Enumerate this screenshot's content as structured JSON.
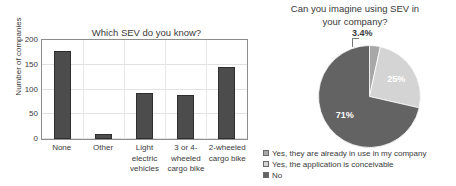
{
  "chart_data": [
    {
      "type": "bar",
      "title": "Which SEV do you know?",
      "xlabel": "",
      "ylabel": "Number of companies",
      "ylim": [
        0,
        200
      ],
      "yticks": [
        0,
        50,
        100,
        150,
        200
      ],
      "grid": true,
      "legend": "none",
      "bar_color": "#4c4c4c",
      "categories": [
        "None",
        "Other",
        "Light electric vehicles",
        "3 or 4- wheeled cargo bike",
        "2-wheeled cargo bike"
      ],
      "category_lines": [
        [
          "None"
        ],
        [
          "Other"
        ],
        [
          "Light",
          "electric",
          "vehicles"
        ],
        [
          "3 or 4-",
          "wheeled",
          "cargo bike"
        ],
        [
          "2-wheeled",
          "cargo bike"
        ]
      ],
      "values": [
        178,
        11,
        92,
        88,
        146
      ]
    },
    {
      "type": "pie",
      "title": "Can you imagine using SEV in your company?",
      "title_lines": [
        "Can you imagine using SEV in",
        "your company?"
      ],
      "legend_position": "bottom",
      "slices": [
        {
          "label": "Yes, they are already in use in my company",
          "value": 3.4,
          "display": "3.4%",
          "color": "#a8a8a8",
          "callout": true
        },
        {
          "label": "Yes, the application is conceivable",
          "value": 25,
          "display": "25%",
          "color": "#d4d4d4",
          "callout": false
        },
        {
          "label": "No",
          "value": 71,
          "display": "71%",
          "color": "#636363",
          "callout": false
        }
      ]
    }
  ],
  "bar_chart": {
    "title": "Which SEV do you know?",
    "ylabel": "Number of companies",
    "yticks": [
      "0",
      "50",
      "100",
      "150",
      "200"
    ],
    "bars": [
      {
        "value": 178,
        "lines": [
          "None"
        ]
      },
      {
        "value": 11,
        "lines": [
          "Other"
        ]
      },
      {
        "value": 92,
        "lines": [
          "Light",
          "electric",
          "vehicles"
        ]
      },
      {
        "value": 88,
        "lines": [
          "3 or 4-",
          "wheeled",
          "cargo bike"
        ]
      },
      {
        "value": 146,
        "lines": [
          "2-wheeled",
          "cargo bike"
        ]
      }
    ]
  },
  "pie_chart": {
    "title_line1": "Can you imagine using SEV in",
    "title_line2": "your company?",
    "callout_value": "3.4%",
    "label_25": "25%",
    "label_71": "71%",
    "legend": [
      {
        "text": "Yes, they are already in use in my company",
        "color": "#a8a8a8"
      },
      {
        "text": "Yes, the application is conceivable",
        "color": "#d4d4d4"
      },
      {
        "text": "No",
        "color": "#636363"
      }
    ]
  },
  "xtick_labels": {
    "c0l0": "None",
    "c1l0": "Other",
    "c2l0": "Light",
    "c2l1": "electric",
    "c2l2": "vehicles",
    "c3l0": "3 or 4-",
    "c3l1": "wheeled",
    "c3l2": "cargo bike",
    "c4l0": "2-wheeled",
    "c4l1": "cargo bike"
  }
}
